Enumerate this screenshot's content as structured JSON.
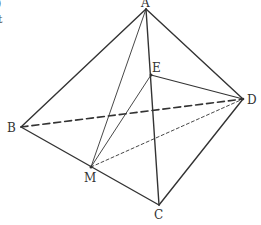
{
  "fragments": [
    ")",
    "t"
  ],
  "points": {
    "A": {
      "label": "A",
      "x": 146,
      "y": 9
    },
    "B": {
      "label": "B",
      "x": 21,
      "y": 127
    },
    "C": {
      "label": "C",
      "x": 159,
      "y": 205
    },
    "D": {
      "label": "D",
      "x": 243,
      "y": 99
    },
    "E": {
      "label": "E",
      "x": 151,
      "y": 75
    },
    "M": {
      "label": "M",
      "x": 91,
      "y": 167
    }
  },
  "edges": {
    "solid": [
      [
        "A",
        "B"
      ],
      [
        "A",
        "D"
      ],
      [
        "A",
        "C"
      ],
      [
        "B",
        "C"
      ],
      [
        "C",
        "D"
      ],
      [
        "E",
        "D"
      ]
    ],
    "thin": [
      [
        "A",
        "M"
      ],
      [
        "E",
        "M"
      ]
    ],
    "dashed": [
      [
        "B",
        "D"
      ]
    ],
    "dotted": [
      [
        "M",
        "D"
      ]
    ]
  },
  "colors": {
    "line": "#333333",
    "background": "#ffffff"
  }
}
